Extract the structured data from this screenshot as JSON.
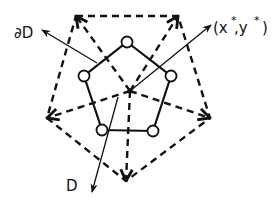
{
  "diagram": {
    "colors": {
      "ink": "#111111",
      "background": "#ffffff"
    },
    "center": {
      "x": 130,
      "y": 91
    },
    "outer_pentagon": {
      "style": "dashed",
      "vertices": [
        {
          "x": 76,
          "y": 16
        },
        {
          "x": 178,
          "y": 16
        },
        {
          "x": 210,
          "y": 118
        },
        {
          "x": 126,
          "y": 181
        },
        {
          "x": 47,
          "y": 118
        }
      ]
    },
    "inner_pentagon": {
      "style": "solid",
      "nodes": [
        {
          "x": 127,
          "y": 42
        },
        {
          "x": 171,
          "y": 76
        },
        {
          "x": 153,
          "y": 131
        },
        {
          "x": 102,
          "y": 130
        },
        {
          "x": 84,
          "y": 76
        }
      ]
    },
    "labels": {
      "boundary": "∂D",
      "domain": "D",
      "point": "(x*,y*)",
      "point_x": "(x",
      "point_star1": "*",
      "point_comma_y": ",y",
      "point_star2": "*",
      "point_close": ")"
    },
    "pointers": {
      "boundary": {
        "from": {
          "x": 97,
          "y": 63
        },
        "to": {
          "x": 42,
          "y": 30
        }
      },
      "domain": {
        "from": {
          "x": 118,
          "y": 97
        },
        "to": {
          "x": 92,
          "y": 192
        }
      },
      "point": {
        "from": {
          "x": 130,
          "y": 91
        },
        "to": {
          "x": 211,
          "y": 25
        }
      }
    }
  }
}
